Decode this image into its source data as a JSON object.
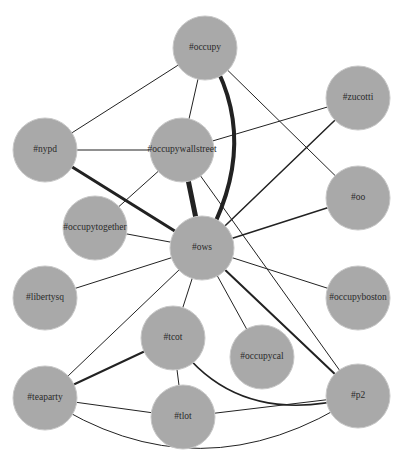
{
  "diagram": {
    "type": "network-graph",
    "node_color": "#a9a9a9",
    "edge_color": "#222222",
    "node_radius": 32,
    "nodes": [
      {
        "id": "occupy",
        "label": "#occupy",
        "x": 205,
        "y": 48
      },
      {
        "id": "nypd",
        "label": "#nypd",
        "x": 45,
        "y": 150
      },
      {
        "id": "occupywallstreet",
        "label": "#occupywallstreet",
        "x": 182,
        "y": 150
      },
      {
        "id": "zucotti",
        "label": "#zucotti",
        "x": 358,
        "y": 98
      },
      {
        "id": "oo",
        "label": "#oo",
        "x": 358,
        "y": 198
      },
      {
        "id": "occupytogether",
        "label": "#occupytogether",
        "x": 95,
        "y": 228
      },
      {
        "id": "ows",
        "label": "#ows",
        "x": 202,
        "y": 248
      },
      {
        "id": "libertysq",
        "label": "#libertysq",
        "x": 45,
        "y": 298
      },
      {
        "id": "occupyboston",
        "label": "#occupyboston",
        "x": 358,
        "y": 298
      },
      {
        "id": "tcot",
        "label": "#tcot",
        "x": 173,
        "y": 338
      },
      {
        "id": "occupycal",
        "label": "#occupycal",
        "x": 262,
        "y": 357
      },
      {
        "id": "teaparty",
        "label": "#teaparty",
        "x": 45,
        "y": 398
      },
      {
        "id": "tlot",
        "label": "#tlot",
        "x": 183,
        "y": 417
      },
      {
        "id": "p2",
        "label": "#p2",
        "x": 358,
        "y": 396
      }
    ],
    "edges": [
      {
        "source": "occupy",
        "target": "nypd",
        "weight": 1
      },
      {
        "source": "occupy",
        "target": "occupywallstreet",
        "weight": 1
      },
      {
        "source": "occupy",
        "target": "ows",
        "weight": 4,
        "curved": true
      },
      {
        "source": "occupy",
        "target": "oo",
        "weight": 1
      },
      {
        "source": "nypd",
        "target": "occupywallstreet",
        "weight": 1.2
      },
      {
        "source": "nypd",
        "target": "ows",
        "weight": 3
      },
      {
        "source": "occupywallstreet",
        "target": "ows",
        "weight": 5
      },
      {
        "source": "occupywallstreet",
        "target": "zucotti",
        "weight": 1
      },
      {
        "source": "occupywallstreet",
        "target": "occupytogether",
        "weight": 1
      },
      {
        "source": "occupywallstreet",
        "target": "p2",
        "weight": 1
      },
      {
        "source": "zucotti",
        "target": "ows",
        "weight": 1.5
      },
      {
        "source": "oo",
        "target": "ows",
        "weight": 1.5
      },
      {
        "source": "occupytogether",
        "target": "ows",
        "weight": 1
      },
      {
        "source": "libertysq",
        "target": "ows",
        "weight": 1
      },
      {
        "source": "occupyboston",
        "target": "ows",
        "weight": 1
      },
      {
        "source": "ows",
        "target": "tcot",
        "weight": 1
      },
      {
        "source": "ows",
        "target": "occupycal",
        "weight": 1
      },
      {
        "source": "ows",
        "target": "teaparty",
        "weight": 1
      },
      {
        "source": "ows",
        "target": "p2",
        "weight": 2
      },
      {
        "source": "tcot",
        "target": "teaparty",
        "weight": 2
      },
      {
        "source": "tcot",
        "target": "tlot",
        "weight": 1
      },
      {
        "source": "tcot",
        "target": "p2",
        "weight": 1.5,
        "curved": true
      },
      {
        "source": "teaparty",
        "target": "tlot",
        "weight": 1
      },
      {
        "source": "teaparty",
        "target": "p2",
        "weight": 1,
        "curved": true
      },
      {
        "source": "tlot",
        "target": "p2",
        "weight": 1
      }
    ]
  }
}
